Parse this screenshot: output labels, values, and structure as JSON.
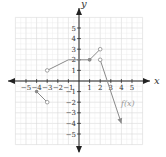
{
  "chart_data": {
    "type": "line",
    "title": "",
    "xlabel": "x",
    "ylabel": "y",
    "xlim": [
      -6,
      6
    ],
    "ylim": [
      -6,
      6
    ],
    "grid": true,
    "x_ticks": [
      "-5",
      "-4",
      "-3",
      "-2",
      "-1",
      "1",
      "2",
      "3",
      "4",
      "5"
    ],
    "y_ticks": [
      "5",
      "4",
      "3",
      "2",
      "1",
      "-1",
      "-2",
      "-3",
      "-4",
      "-5"
    ],
    "function_label": "f(x)",
    "series": [
      {
        "name": "segment-1",
        "points": [
          [
            -4,
            -1
          ],
          [
            -3,
            -2
          ]
        ],
        "start": "closed",
        "end": "open"
      },
      {
        "name": "segment-2",
        "points": [
          [
            -3,
            1
          ],
          [
            -1,
            2
          ],
          [
            1,
            2
          ]
        ],
        "start": "open",
        "end": "closed"
      },
      {
        "name": "segment-3",
        "points": [
          [
            1,
            2
          ],
          [
            2,
            3
          ]
        ],
        "start": "closed",
        "end": "open"
      },
      {
        "name": "segment-4",
        "points": [
          [
            2,
            2
          ],
          [
            4,
            -4
          ]
        ],
        "start": "open",
        "end": "arrow"
      }
    ]
  },
  "colors": {
    "axis": "#222222",
    "grid": "#d8d8d8",
    "curve": "#8a8a8a",
    "text": "#333333"
  }
}
